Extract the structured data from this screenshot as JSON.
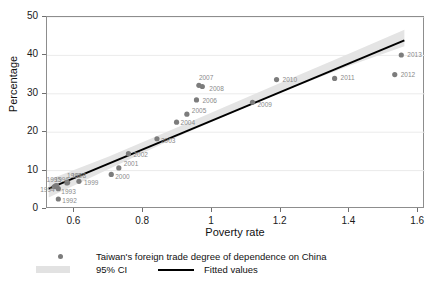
{
  "chart_data": {
    "type": "scatter",
    "title": "",
    "xlabel": "Poverty rate",
    "ylabel": "Percentage",
    "xlim": [
      0.52,
      1.62
    ],
    "ylim": [
      0,
      50
    ],
    "xticks": [
      "0.6",
      "0.8",
      "1",
      "1.2",
      "1.4",
      "1.6"
    ],
    "xtick_values": [
      0.6,
      0.8,
      1.0,
      1.2,
      1.4,
      1.6
    ],
    "yticks": [
      "0",
      "10",
      "20",
      "30",
      "40",
      "50"
    ],
    "ytick_values": [
      0,
      10,
      20,
      30,
      40,
      50
    ],
    "grid": "horizontal",
    "legend_position": "below-axis",
    "series": [
      {
        "name": "Taiwan's foreign trade degree of dependence on China",
        "type": "scatter",
        "marker": "circle",
        "color": "#7c7c7c",
        "points": [
          {
            "label": "1992",
            "x": 0.553,
            "y": 2.6
          },
          {
            "label": "1993",
            "x": 0.553,
            "y": 5.3
          },
          {
            "label": "1994",
            "x": 0.541,
            "y": 5.8
          },
          {
            "label": "1995",
            "x": 0.545,
            "y": 6.0
          },
          {
            "label": "1996",
            "x": 0.548,
            "y": 6.1
          },
          {
            "label": "1997",
            "x": 0.578,
            "y": 6.8
          },
          {
            "label": "1998",
            "x": 0.58,
            "y": 6.9
          },
          {
            "label": "1999",
            "x": 0.613,
            "y": 7.2
          },
          {
            "label": "2000",
            "x": 0.707,
            "y": 9.0
          },
          {
            "label": "2001",
            "x": 0.729,
            "y": 10.7
          },
          {
            "label": "2002",
            "x": 0.757,
            "y": 14.4
          },
          {
            "label": "2003",
            "x": 0.84,
            "y": 18.3
          },
          {
            "label": "2004",
            "x": 0.897,
            "y": 22.6
          },
          {
            "label": "2005",
            "x": 0.927,
            "y": 24.7
          },
          {
            "label": "2006",
            "x": 0.955,
            "y": 28.4
          },
          {
            "label": "2007",
            "x": 0.962,
            "y": 32.2
          },
          {
            "label": "2008",
            "x": 0.972,
            "y": 31.9
          },
          {
            "label": "2009",
            "x": 1.118,
            "y": 27.8
          },
          {
            "label": "2010",
            "x": 1.188,
            "y": 33.7
          },
          {
            "label": "2011",
            "x": 1.357,
            "y": 34.0
          },
          {
            "label": "2012",
            "x": 1.532,
            "y": 35.0
          },
          {
            "label": "2013",
            "x": 1.551,
            "y": 40.1
          }
        ]
      },
      {
        "name": "Fitted values",
        "type": "line",
        "color": "#000000",
        "x": [
          0.525,
          1.56
        ],
        "y": [
          5.3,
          43.9
        ]
      },
      {
        "name": "95% CI",
        "type": "band",
        "color": "#e4e4e4",
        "x": [
          0.525,
          0.7,
          0.9,
          1.05,
          1.2,
          1.4,
          1.56
        ],
        "upper": [
          7.6,
          13.7,
          21.3,
          27.1,
          32.9,
          40.5,
          46.7
        ],
        "lower": [
          3.0,
          10.4,
          18.8,
          24.7,
          30.4,
          37.3,
          42.4
        ]
      }
    ]
  },
  "axes": {
    "x_title": "Poverty rate",
    "y_title": "Percentage"
  },
  "legend": {
    "scatter_label": "Taiwan's foreign trade degree of dependence on China",
    "ci_label": "95% CI",
    "fit_label": "Fitted values"
  }
}
